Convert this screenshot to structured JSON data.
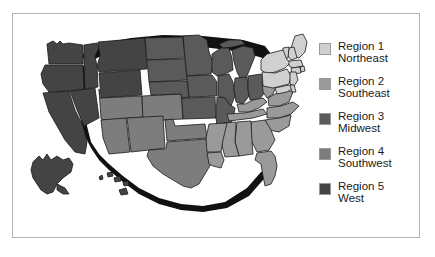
{
  "figure": {
    "frame_color": "#b3b3b3",
    "background": "#ffffff"
  },
  "map": {
    "name": "united-states-regions-map",
    "outline_color": "#1a1a1a",
    "shadow_color": "#111111",
    "insets": [
      "Alaska",
      "Hawaii"
    ],
    "regions": [
      {
        "id": "region1",
        "name": "Northeast",
        "color": "#d0d0d0",
        "states": [
          "Maine",
          "New Hampshire",
          "Vermont",
          "Massachusetts",
          "Rhode Island",
          "Connecticut",
          "New York",
          "Pennsylvania",
          "New Jersey",
          "Delaware",
          "Maryland"
        ]
      },
      {
        "id": "region2",
        "name": "Southeast",
        "color": "#9a9a9a",
        "states": [
          "West Virginia",
          "Virginia",
          "North Carolina",
          "South Carolina",
          "Georgia",
          "Florida",
          "Alabama",
          "Mississippi",
          "Tennessee",
          "Kentucky",
          "Arkansas",
          "Louisiana"
        ]
      },
      {
        "id": "region3",
        "name": "Midwest",
        "color": "#5a5a5a",
        "states": [
          "Ohio",
          "Indiana",
          "Illinois",
          "Michigan",
          "Wisconsin",
          "Minnesota",
          "Iowa",
          "Missouri",
          "North Dakota",
          "South Dakota",
          "Nebraska",
          "Kansas"
        ]
      },
      {
        "id": "region4",
        "name": "Southwest",
        "color": "#7d7d7d",
        "states": [
          "Texas",
          "Oklahoma",
          "New Mexico",
          "Arizona",
          "Colorado",
          "Utah"
        ]
      },
      {
        "id": "region5",
        "name": "West",
        "color": "#444444",
        "states": [
          "Washington",
          "Oregon",
          "California",
          "Nevada",
          "Idaho",
          "Montana",
          "Wyoming",
          "Alaska",
          "Hawaii"
        ]
      }
    ]
  },
  "legend": {
    "items": [
      {
        "label_line1": "Region 1",
        "label_line2": "Northeast",
        "color": "#d0d0d0"
      },
      {
        "label_line1": "Region 2",
        "label_line2": "Southeast",
        "color": "#9a9a9a"
      },
      {
        "label_line1": "Region 3",
        "label_line2": "Midwest",
        "color": "#5a5a5a"
      },
      {
        "label_line1": "Region 4",
        "label_line2": "Southwest",
        "color": "#7d7d7d"
      },
      {
        "label_line1": "Region 5",
        "label_line2": "West",
        "color": "#444444"
      }
    ]
  }
}
